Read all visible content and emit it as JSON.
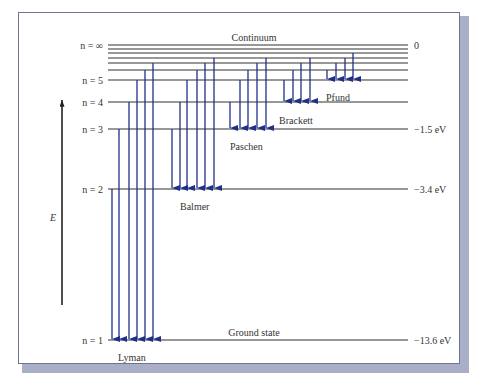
{
  "diagram": {
    "axis": {
      "label": "E"
    },
    "levels": [
      {
        "n": "n = ∞",
        "y": 45,
        "energy": "0",
        "caption": "Continuum"
      },
      {
        "n": "",
        "y": 49,
        "energy": ""
      },
      {
        "n": "",
        "y": 53,
        "energy": ""
      },
      {
        "n": "",
        "y": 58,
        "energy": ""
      },
      {
        "n": "",
        "y": 63,
        "energy": ""
      },
      {
        "n": "",
        "y": 70,
        "energy": ""
      },
      {
        "n": "n = 5",
        "y": 80,
        "energy": ""
      },
      {
        "n": "n = 4",
        "y": 102,
        "energy": ""
      },
      {
        "n": "n = 3",
        "y": 129,
        "energy": "−1.5 eV"
      },
      {
        "n": "n = 2",
        "y": 189,
        "energy": "−3.4 eV"
      },
      {
        "n": "n = 1",
        "y": 340,
        "energy": "−13.6 eV",
        "caption": "Ground state"
      }
    ],
    "series": [
      {
        "name": "Lyman",
        "label_x": 118,
        "label_y": 352,
        "target_y": 340,
        "arrows": [
          {
            "x": 112,
            "from": 189
          },
          {
            "x": 119,
            "from": 129
          },
          {
            "x": 129,
            "from": 102
          },
          {
            "x": 137,
            "from": 80
          },
          {
            "x": 145,
            "from": 70
          },
          {
            "x": 153,
            "from": 63
          }
        ]
      },
      {
        "name": "Balmer",
        "label_x": 180,
        "label_y": 201,
        "target_y": 189,
        "arrows": [
          {
            "x": 172,
            "from": 129
          },
          {
            "x": 180,
            "from": 102
          },
          {
            "x": 187,
            "from": 80
          },
          {
            "x": 197,
            "from": 70
          },
          {
            "x": 205,
            "from": 63
          },
          {
            "x": 214,
            "from": 58
          }
        ]
      },
      {
        "name": "Paschen",
        "label_x": 230,
        "label_y": 141,
        "target_y": 129,
        "arrows": [
          {
            "x": 230,
            "from": 102
          },
          {
            "x": 240,
            "from": 80
          },
          {
            "x": 248,
            "from": 70
          },
          {
            "x": 257,
            "from": 63
          },
          {
            "x": 266,
            "from": 58
          }
        ]
      },
      {
        "name": "Brackett",
        "label_x": 279,
        "label_y": 115,
        "target_y": 102,
        "arrows": [
          {
            "x": 284,
            "from": 80
          },
          {
            "x": 293,
            "from": 70
          },
          {
            "x": 301,
            "from": 63
          },
          {
            "x": 310,
            "from": 58
          }
        ]
      },
      {
        "name": "Pfund",
        "label_x": 326,
        "label_y": 92,
        "target_y": 80,
        "arrows": [
          {
            "x": 327,
            "from": 70
          },
          {
            "x": 336,
            "from": 63
          },
          {
            "x": 345,
            "from": 58
          },
          {
            "x": 353,
            "from": 53
          }
        ]
      }
    ],
    "colors": {
      "arrow": "#1f2f8a",
      "level": "#333333",
      "frame_shadow": "#a9afc6"
    }
  }
}
